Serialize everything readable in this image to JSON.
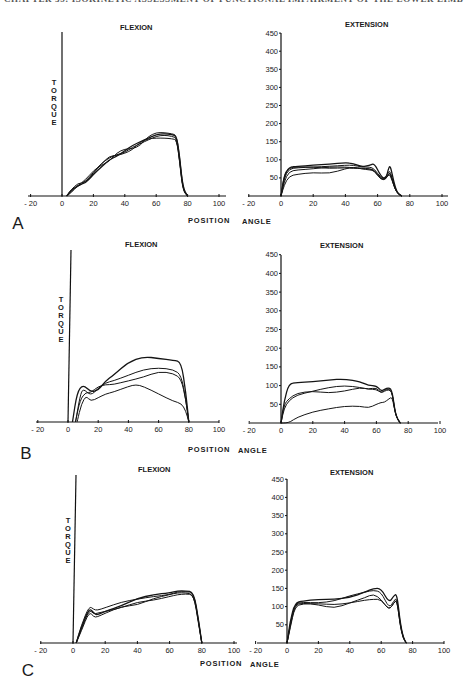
{
  "running_head": "CHAPTER 35: ISOKINETIC ASSESSMENT OF FUNCTIONAL IMPAIRMENT OF THE LOWER LIMB",
  "labels": {
    "flexion": "FLEXION",
    "extension": "EXTENSION",
    "torque": "TORQUE",
    "position": "POSITION",
    "angle": "ANGLE"
  },
  "chart_data": [
    {
      "panel": "A",
      "title": "FLEXION",
      "type": "line",
      "xlabel": "POSITION ANGLE",
      "ylabel": "TORQUE",
      "xticks": [
        -20,
        0,
        20,
        40,
        60,
        80,
        100
      ],
      "xlim": [
        -20,
        100
      ],
      "ylim": [
        0,
        450
      ],
      "series": [
        {
          "name": "trial 1",
          "x": [
            3,
            6,
            10,
            15,
            20,
            25,
            30,
            35,
            40,
            45,
            50,
            55,
            60,
            65,
            70,
            73,
            75,
            77,
            80
          ],
          "y": [
            0,
            15,
            30,
            35,
            60,
            80,
            100,
            110,
            125,
            140,
            150,
            160,
            170,
            172,
            170,
            165,
            100,
            20,
            0
          ]
        },
        {
          "name": "trial 2",
          "x": [
            3,
            6,
            10,
            15,
            20,
            25,
            30,
            35,
            40,
            45,
            50,
            55,
            60,
            65,
            70,
            73,
            75,
            77,
            80
          ],
          "y": [
            0,
            20,
            25,
            40,
            65,
            90,
            105,
            115,
            120,
            135,
            145,
            155,
            165,
            168,
            165,
            160,
            90,
            15,
            0
          ]
        },
        {
          "name": "trial 3",
          "x": [
            3,
            6,
            10,
            15,
            20,
            25,
            30,
            35,
            40,
            45,
            50,
            55,
            60,
            65,
            70,
            73,
            75,
            77,
            80
          ],
          "y": [
            0,
            10,
            28,
            45,
            70,
            85,
            95,
            120,
            130,
            130,
            140,
            165,
            175,
            175,
            172,
            168,
            110,
            25,
            0
          ]
        },
        {
          "name": "trial 4",
          "x": [
            3,
            6,
            10,
            15,
            20,
            25,
            30,
            35,
            40,
            45,
            50,
            55,
            60,
            65,
            70,
            73,
            75,
            77,
            80
          ],
          "y": [
            0,
            18,
            35,
            38,
            62,
            88,
            110,
            112,
            118,
            128,
            150,
            158,
            160,
            160,
            158,
            155,
            95,
            18,
            0
          ]
        }
      ]
    },
    {
      "panel": "A",
      "title": "EXTENSION",
      "type": "line",
      "xlabel": "POSITION ANGLE",
      "ylabel": "",
      "xticks": [
        -20,
        0,
        20,
        40,
        60,
        80,
        100
      ],
      "yticks": [
        50,
        100,
        150,
        200,
        250,
        300,
        350,
        400,
        450
      ],
      "xlim": [
        -20,
        100
      ],
      "ylim": [
        0,
        450
      ],
      "series": [
        {
          "name": "trial 1",
          "x": [
            0,
            2,
            5,
            10,
            20,
            30,
            40,
            45,
            50,
            55,
            58,
            62,
            65,
            67,
            68,
            70,
            72,
            75
          ],
          "y": [
            0,
            55,
            80,
            82,
            85,
            88,
            92,
            90,
            80,
            85,
            90,
            55,
            45,
            80,
            82,
            40,
            10,
            0
          ]
        },
        {
          "name": "trial 2",
          "x": [
            0,
            2,
            5,
            10,
            20,
            30,
            40,
            45,
            50,
            55,
            58,
            62,
            65,
            67,
            68,
            70,
            72,
            75
          ],
          "y": [
            0,
            50,
            75,
            78,
            80,
            82,
            85,
            85,
            80,
            80,
            75,
            50,
            50,
            70,
            65,
            35,
            10,
            0
          ]
        },
        {
          "name": "trial 3",
          "x": [
            0,
            2,
            5,
            10,
            20,
            30,
            40,
            45,
            50,
            55,
            58,
            62,
            65,
            67,
            68,
            70,
            72,
            75
          ],
          "y": [
            0,
            40,
            68,
            72,
            75,
            80,
            80,
            78,
            75,
            75,
            72,
            48,
            45,
            65,
            60,
            30,
            8,
            0
          ]
        },
        {
          "name": "trial 4",
          "x": [
            0,
            2,
            5,
            10,
            20,
            30,
            40,
            45,
            50,
            55,
            58,
            62,
            65,
            67,
            68,
            70,
            72,
            75
          ],
          "y": [
            0,
            30,
            55,
            60,
            65,
            62,
            75,
            80,
            75,
            72,
            70,
            45,
            48,
            60,
            55,
            30,
            8,
            0
          ]
        },
        {
          "name": "trial 5",
          "x": [
            0,
            2,
            5,
            10,
            20,
            30,
            40,
            45,
            50,
            55,
            58,
            62,
            65,
            67,
            68,
            70,
            72,
            75
          ],
          "y": [
            0,
            60,
            78,
            80,
            80,
            76,
            78,
            76,
            78,
            75,
            70,
            45,
            45,
            62,
            62,
            30,
            8,
            0
          ]
        }
      ]
    },
    {
      "panel": "B",
      "title": "FLEXION",
      "type": "line",
      "xlabel": "POSITION ANGLE",
      "ylabel": "TORQUE",
      "xticks": [
        -20,
        0,
        20,
        40,
        60,
        80,
        100
      ],
      "xlim": [
        -20,
        100
      ],
      "ylim": [
        0,
        450
      ],
      "series": [
        {
          "name": "trial 1",
          "x": [
            3,
            6,
            10,
            15,
            20,
            25,
            30,
            40,
            50,
            60,
            70,
            75,
            78,
            80
          ],
          "y": [
            0,
            80,
            100,
            80,
            85,
            110,
            125,
            160,
            175,
            170,
            165,
            160,
            80,
            0
          ]
        },
        {
          "name": "trial 2",
          "x": [
            5,
            8,
            10,
            15,
            20,
            25,
            30,
            40,
            50,
            60,
            70,
            75,
            78,
            80
          ],
          "y": [
            0,
            70,
            90,
            70,
            90,
            105,
            110,
            125,
            140,
            145,
            140,
            125,
            60,
            0
          ]
        },
        {
          "name": "trial 3",
          "x": [
            5,
            8,
            12,
            15,
            20,
            25,
            30,
            40,
            50,
            60,
            70,
            75,
            78,
            80
          ],
          "y": [
            0,
            60,
            80,
            78,
            95,
            100,
            100,
            110,
            120,
            135,
            130,
            115,
            60,
            0
          ]
        },
        {
          "name": "trial 4",
          "x": [
            6,
            9,
            12,
            15,
            20,
            25,
            30,
            40,
            45,
            50,
            60,
            70,
            75,
            78,
            80
          ],
          "y": [
            0,
            50,
            70,
            55,
            65,
            75,
            80,
            95,
            100,
            95,
            75,
            55,
            50,
            30,
            0
          ]
        }
      ]
    },
    {
      "panel": "B",
      "title": "EXTENSION",
      "type": "line",
      "xlabel": "POSITION ANGLE",
      "ylabel": "",
      "xticks": [
        -20,
        0,
        20,
        40,
        60,
        80,
        100
      ],
      "yticks": [
        50,
        100,
        150,
        200,
        250,
        300,
        350,
        400,
        450
      ],
      "xlim": [
        -20,
        100
      ],
      "ylim": [
        0,
        450
      ],
      "series": [
        {
          "name": "trial 1",
          "x": [
            0,
            2,
            5,
            10,
            20,
            30,
            40,
            50,
            55,
            60,
            63,
            65,
            68,
            70,
            72,
            75
          ],
          "y": [
            0,
            60,
            105,
            108,
            110,
            115,
            118,
            110,
            100,
            100,
            85,
            90,
            95,
            85,
            20,
            0
          ]
        },
        {
          "name": "trial 2",
          "x": [
            0,
            2,
            5,
            10,
            20,
            30,
            40,
            50,
            55,
            60,
            63,
            65,
            68,
            70,
            72,
            75
          ],
          "y": [
            0,
            40,
            60,
            75,
            85,
            95,
            100,
            95,
            90,
            95,
            80,
            85,
            90,
            80,
            20,
            0
          ]
        },
        {
          "name": "trial 3",
          "x": [
            0,
            2,
            5,
            10,
            20,
            30,
            40,
            50,
            55,
            60,
            63,
            65,
            68,
            70,
            72,
            75
          ],
          "y": [
            0,
            50,
            65,
            80,
            85,
            80,
            85,
            95,
            90,
            90,
            80,
            88,
            92,
            80,
            20,
            0
          ]
        },
        {
          "name": "trial 4",
          "x": [
            0,
            3,
            6,
            10,
            20,
            30,
            40,
            50,
            55,
            60,
            63,
            65,
            68,
            70,
            72,
            75
          ],
          "y": [
            0,
            0,
            3,
            15,
            30,
            38,
            45,
            45,
            40,
            50,
            55,
            55,
            65,
            70,
            20,
            0
          ]
        }
      ]
    },
    {
      "panel": "C",
      "title": "FLEXION",
      "type": "line",
      "xlabel": "POSITION ANGLE",
      "ylabel": "TORQUE",
      "xticks": [
        -20,
        0,
        20,
        40,
        60,
        80,
        100
      ],
      "xlim": [
        -20,
        100
      ],
      "ylim": [
        0,
        450
      ],
      "series": [
        {
          "name": "trial 1",
          "x": [
            2,
            5,
            10,
            13,
            15,
            20,
            30,
            40,
            50,
            60,
            65,
            70,
            75,
            78,
            80
          ],
          "y": [
            0,
            40,
            95,
            80,
            75,
            85,
            100,
            120,
            130,
            135,
            140,
            140,
            138,
            60,
            0
          ]
        },
        {
          "name": "trial 2",
          "x": [
            2,
            5,
            10,
            13,
            15,
            20,
            30,
            40,
            50,
            60,
            65,
            70,
            75,
            78,
            80
          ],
          "y": [
            0,
            45,
            100,
            90,
            88,
            95,
            110,
            118,
            125,
            130,
            138,
            138,
            135,
            60,
            0
          ]
        },
        {
          "name": "trial 3",
          "x": [
            2,
            5,
            10,
            13,
            15,
            20,
            30,
            40,
            50,
            60,
            65,
            70,
            75,
            78,
            80
          ],
          "y": [
            0,
            35,
            90,
            78,
            80,
            85,
            95,
            110,
            115,
            125,
            130,
            132,
            130,
            55,
            0
          ]
        },
        {
          "name": "trial 4",
          "x": [
            2,
            5,
            10,
            13,
            15,
            20,
            30,
            40,
            50,
            60,
            65,
            70,
            75,
            78,
            80
          ],
          "y": [
            0,
            30,
            85,
            70,
            70,
            80,
            98,
            102,
            120,
            130,
            135,
            135,
            130,
            50,
            0
          ]
        }
      ]
    },
    {
      "panel": "C",
      "title": "EXTENSION",
      "type": "line",
      "xlabel": "POSITION ANGLE",
      "ylabel": "",
      "xticks": [
        -20,
        0,
        20,
        40,
        60,
        80,
        100
      ],
      "yticks": [
        50,
        100,
        150,
        200,
        250,
        300,
        350,
        400,
        450
      ],
      "xlim": [
        -20,
        100
      ],
      "ylim": [
        0,
        450
      ],
      "series": [
        {
          "name": "trial 1",
          "x": [
            0,
            2,
            5,
            10,
            20,
            30,
            40,
            50,
            55,
            60,
            65,
            68,
            70,
            72,
            74,
            76
          ],
          "y": [
            0,
            60,
            110,
            115,
            120,
            120,
            125,
            140,
            150,
            150,
            110,
            130,
            135,
            60,
            15,
            0
          ]
        },
        {
          "name": "trial 2",
          "x": [
            0,
            2,
            5,
            10,
            20,
            30,
            40,
            50,
            55,
            60,
            65,
            68,
            70,
            72,
            74,
            76
          ],
          "y": [
            0,
            50,
            108,
            112,
            110,
            115,
            130,
            140,
            145,
            140,
            95,
            115,
            125,
            55,
            15,
            0
          ]
        },
        {
          "name": "trial 3",
          "x": [
            0,
            2,
            5,
            10,
            20,
            30,
            40,
            50,
            55,
            60,
            65,
            68,
            70,
            72,
            74,
            76
          ],
          "y": [
            0,
            45,
            105,
            110,
            105,
            95,
            110,
            125,
            135,
            120,
            90,
            110,
            120,
            50,
            12,
            0
          ]
        },
        {
          "name": "trial 4",
          "x": [
            0,
            2,
            5,
            10,
            20,
            30,
            40,
            50,
            55,
            60,
            65,
            68,
            70,
            72,
            74,
            76
          ],
          "y": [
            0,
            40,
            100,
            108,
            108,
            105,
            110,
            118,
            120,
            120,
            90,
            110,
            118,
            50,
            12,
            0
          ]
        }
      ]
    }
  ],
  "panel_letters": [
    "A",
    "B",
    "C"
  ]
}
